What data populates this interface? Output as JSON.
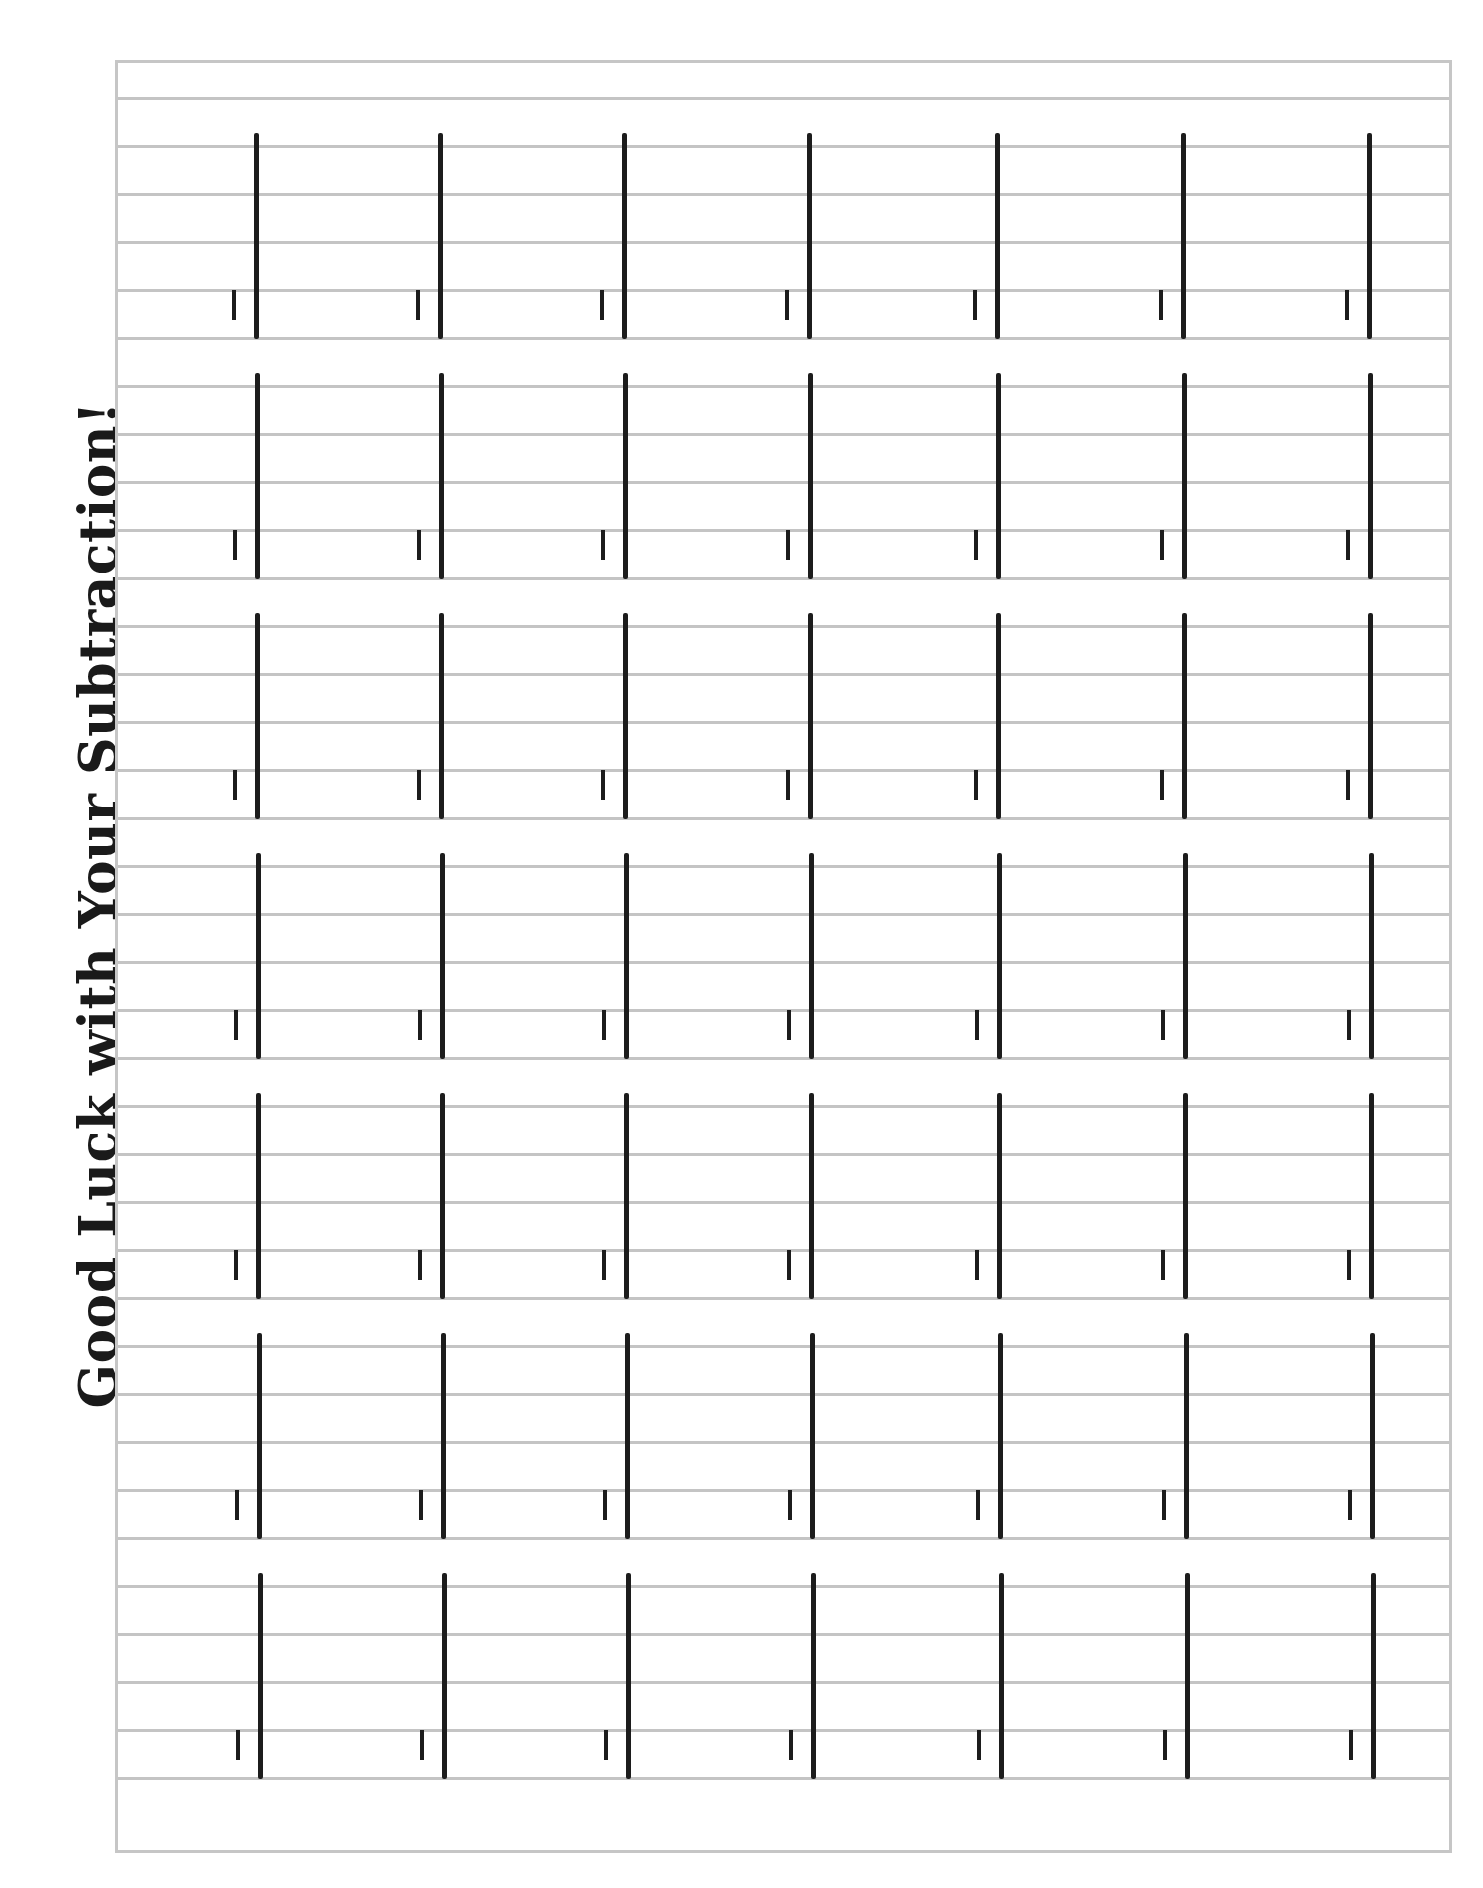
{
  "worksheet": {
    "title": "Good Luck with Your Subtraction!",
    "rows": 7,
    "columns": 7,
    "problem_count": 49,
    "operation_mark": "minus",
    "colors": {
      "text": "#1a1a1a",
      "rule_lines": "#c4c4c4",
      "border": "#c6c6c6",
      "bars": "#1c1c1c"
    }
  }
}
